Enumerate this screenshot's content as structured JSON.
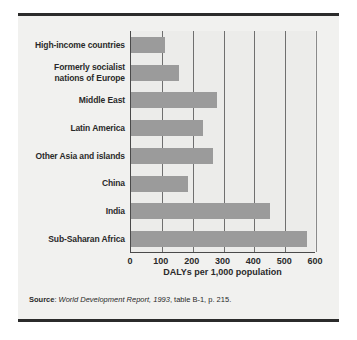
{
  "figure": {
    "background_color": "#f1f1ef",
    "bar_color": "#9b9b9b",
    "axis_color": "#4a4a4a",
    "rule_color": "#2b2b2b"
  },
  "chart_data": {
    "type": "bar",
    "orientation": "horizontal",
    "title": "",
    "subtitle": "",
    "xlabel": "DALYs per 1,000 population",
    "ylabel": "",
    "xlim": [
      0,
      600
    ],
    "xticks": [
      0,
      100,
      200,
      300,
      400,
      500,
      600
    ],
    "xtick_labels": [
      "0",
      "100",
      "200",
      "300",
      "400",
      "500",
      "600"
    ],
    "grid": true,
    "grid_axis": "x",
    "legend": false,
    "categories": [
      "High-income countries",
      "Formerly socialist\nnations of Europe",
      "Middle East",
      "Latin America",
      "Other Asia and islands",
      "China",
      "India",
      "Sub-Saharan Africa"
    ],
    "values": [
      110,
      155,
      280,
      235,
      265,
      185,
      450,
      570
    ],
    "series": [
      {
        "name": "DALYs per 1,000 population",
        "values": [
          110,
          155,
          280,
          235,
          265,
          185,
          450,
          570
        ]
      }
    ]
  },
  "labels": [
    {
      "lines": [
        "High-income countries"
      ]
    },
    {
      "lines": [
        "Formerly socialist",
        "nations of Europe"
      ]
    },
    {
      "lines": [
        "Middle East"
      ]
    },
    {
      "lines": [
        "Latin America"
      ]
    },
    {
      "lines": [
        "Other Asia and islands"
      ]
    },
    {
      "lines": [
        "China"
      ]
    },
    {
      "lines": [
        "India"
      ]
    },
    {
      "lines": [
        "Sub-Saharan Africa"
      ]
    }
  ],
  "source": {
    "label": "Source",
    "separator": ": ",
    "italic_part": "World Development Report, 1993",
    "rest": ", table B-1, p. 215."
  }
}
